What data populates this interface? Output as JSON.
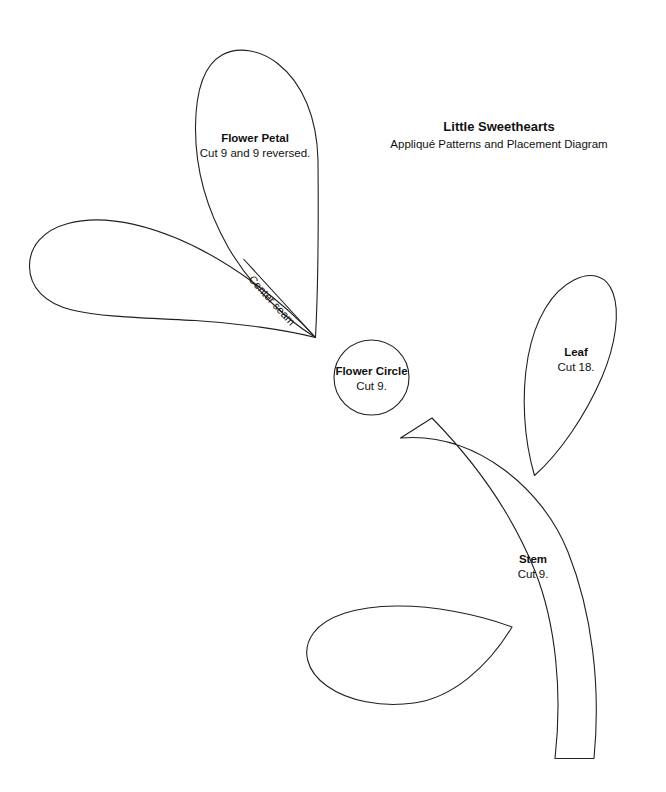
{
  "document": {
    "title": "Little Sweethearts",
    "subtitle": "Appliqué Patterns and Placement Diagram",
    "background_color": "#ffffff",
    "line_color": "#231f20",
    "text_color": "#111111"
  },
  "pieces": {
    "flower_petal": {
      "name": "Flower Petal",
      "cut_instruction": "Cut 9 and 9 reversed.",
      "seam_label": "Center seam"
    },
    "flower_circle": {
      "name": "Flower Circle",
      "cut_instruction": "Cut 9."
    },
    "leaf": {
      "name": "Leaf",
      "cut_instruction": "Cut 18."
    },
    "stem": {
      "name": "Stem",
      "cut_instruction": "Cut 9."
    }
  }
}
